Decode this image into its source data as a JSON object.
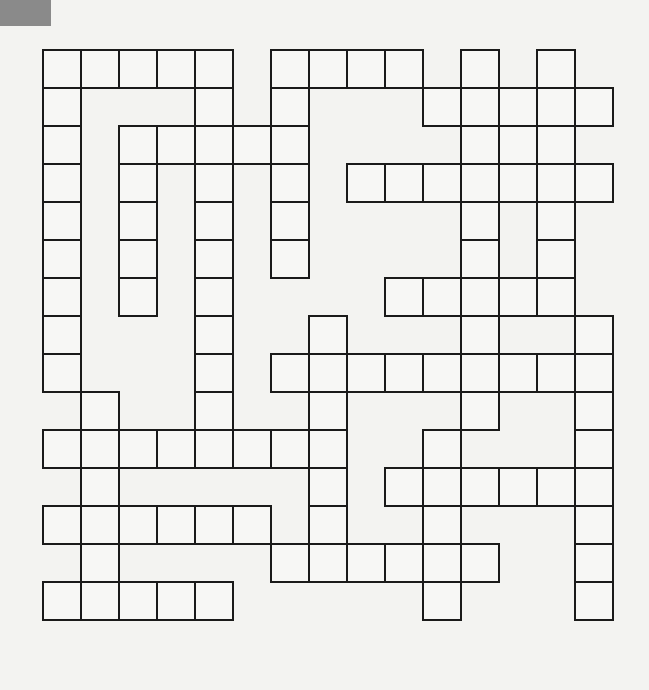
{
  "puzzle": {
    "type": "crossword-grid",
    "cell_size": 38,
    "columns": 15,
    "rows": 15,
    "grid": [
      "11111011110101.",
      "100010100011111",
      "101111100001110",
      "101010101111111",
      "101010100001010",
      "101010100001010",
      "101010000111110",
      "100010010001001",
      "100010111111111",
      "010010010001001",
      "111111110010001",
      "010000010111111",
      "111111010010001",
      "010000111111001",
      "111110000010001"
    ],
    "colors": {
      "border": "#1a1a1a",
      "cell": "#f7f7f5",
      "background": "#f3f3f1",
      "corner_tab": "#8a8a8a"
    }
  }
}
